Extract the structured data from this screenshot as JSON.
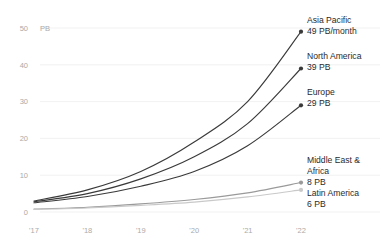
{
  "chart_data": {
    "type": "line",
    "title": "",
    "subtitle": "",
    "xlabel": "",
    "ylabel": "PB",
    "unit_label": "PB",
    "x": [
      "'17",
      "'18",
      "'19",
      "'20",
      "'21",
      "'22"
    ],
    "categories": [
      "'17",
      "'18",
      "'19",
      "'20",
      "'21",
      "'22"
    ],
    "xtick_labels": [
      "'17",
      "'18",
      "'19",
      "'20",
      "'21",
      "'22"
    ],
    "ytick_labels": [
      "0",
      "10",
      "20",
      "30",
      "40",
      "50"
    ],
    "ytick_values": [
      0,
      10,
      20,
      30,
      40,
      50
    ],
    "ylim": [
      0,
      50
    ],
    "grid": true,
    "grid_axis": "y",
    "legend": "none",
    "legend_position": "right-inline-annotations",
    "series": [
      {
        "name": "Asia Pacific",
        "values": [
          3,
          6,
          11,
          19,
          30,
          49
        ],
        "end_value": 49,
        "end_label": "49  PB/month",
        "color": "#3a3a3a",
        "marker": "circle"
      },
      {
        "name": "North America",
        "values": [
          2.8,
          5,
          9,
          15,
          24,
          39
        ],
        "end_value": 39,
        "end_label": "39  PB",
        "color": "#3a3a3a",
        "marker": "circle"
      },
      {
        "name": "Europe",
        "values": [
          2.5,
          4.2,
          7,
          11,
          18,
          29
        ],
        "end_value": 29,
        "end_label": "29  PB",
        "color": "#3a3a3a",
        "marker": "circle"
      },
      {
        "name": "Middle East & Africa",
        "values": [
          0.8,
          1.3,
          2.2,
          3.4,
          5.2,
          8
        ],
        "end_value": 8,
        "end_label": "8  PB",
        "color": "#9a9a9a",
        "marker": "circle"
      },
      {
        "name": "Latin America",
        "values": [
          0.7,
          1.1,
          1.8,
          2.7,
          4.1,
          6
        ],
        "end_value": 6,
        "end_label": "6  PB",
        "color": "#c9c9c9",
        "marker": "circle"
      }
    ],
    "annotations": [
      {
        "name": "Asia Pacific",
        "name_line2": "",
        "value_label": "49  PB/month"
      },
      {
        "name": "North America",
        "name_line2": "",
        "value_label": "39  PB"
      },
      {
        "name": "Europe",
        "name_line2": "",
        "value_label": "29  PB"
      },
      {
        "name": "Middle East &",
        "name_line2": "Africa",
        "value_label": "8  PB"
      },
      {
        "name": "Latin America",
        "name_line2": "",
        "value_label": "6  PB"
      }
    ]
  }
}
